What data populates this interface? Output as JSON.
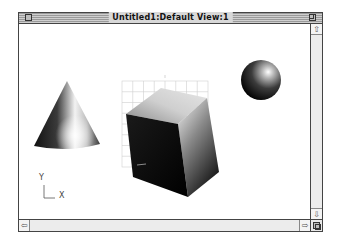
{
  "window": {
    "title": "Untitled1:Default View:1"
  },
  "scrollbars": {
    "up_arrow": "⇧",
    "down_arrow": "⇩",
    "left_arrow": "⇦",
    "right_arrow": "⇨"
  },
  "scene": {
    "objects": [
      "cone",
      "cube",
      "sphere"
    ],
    "axis_indicator": {
      "y_label": "Y",
      "x_label": "X"
    },
    "colors": {
      "background": "#ffffff",
      "grid": "#cccccc",
      "shape_dark": "#000000",
      "shape_light": "#ffffff"
    }
  }
}
